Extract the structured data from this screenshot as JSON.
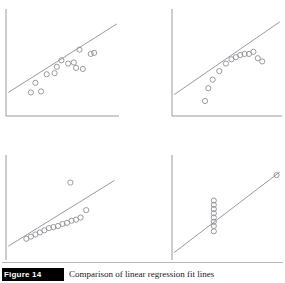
{
  "figure": {
    "caption_tag": "Figure 14",
    "caption_text": "Comparison of linear regression fit lines",
    "background_color": "#ffffff",
    "axis_color": "#9a9aa0",
    "line_color": "#8d8d97",
    "marker_color": "#8f8f99",
    "marker_radius": 2.6,
    "marker_stroke_width": 0.9
  },
  "chart_data": [
    {
      "id": "panel-top-left",
      "type": "scatter",
      "title": "",
      "xlabel": "",
      "ylabel": "",
      "xlim": [
        0,
        100
      ],
      "ylim": [
        0,
        100
      ],
      "grid": false,
      "legend": "none",
      "fit_line": {
        "x": [
          2,
          98
        ],
        "y": [
          22,
          86
        ]
      },
      "points": [
        {
          "x": 22,
          "y": 22
        },
        {
          "x": 31,
          "y": 23
        },
        {
          "x": 26,
          "y": 31
        },
        {
          "x": 36,
          "y": 39
        },
        {
          "x": 43,
          "y": 40
        },
        {
          "x": 45,
          "y": 46
        },
        {
          "x": 49,
          "y": 52
        },
        {
          "x": 55,
          "y": 49
        },
        {
          "x": 60,
          "y": 50
        },
        {
          "x": 62,
          "y": 45
        },
        {
          "x": 68,
          "y": 44
        },
        {
          "x": 65,
          "y": 62
        },
        {
          "x": 75,
          "y": 58
        },
        {
          "x": 78,
          "y": 59
        }
      ]
    },
    {
      "id": "panel-top-right",
      "type": "scatter",
      "title": "",
      "xlabel": "",
      "ylabel": "",
      "xlim": [
        0,
        100
      ],
      "ylim": [
        0,
        100
      ],
      "grid": false,
      "legend": "none",
      "fit_line": {
        "x": [
          2,
          98
        ],
        "y": [
          20,
          88
        ]
      },
      "points": [
        {
          "x": 30,
          "y": 14
        },
        {
          "x": 33,
          "y": 26
        },
        {
          "x": 37,
          "y": 34
        },
        {
          "x": 43,
          "y": 42
        },
        {
          "x": 49,
          "y": 49
        },
        {
          "x": 54,
          "y": 53
        },
        {
          "x": 58,
          "y": 55
        },
        {
          "x": 62,
          "y": 57
        },
        {
          "x": 66,
          "y": 58
        },
        {
          "x": 70,
          "y": 58
        },
        {
          "x": 74,
          "y": 60
        },
        {
          "x": 78,
          "y": 54
        },
        {
          "x": 82,
          "y": 51
        }
      ]
    },
    {
      "id": "panel-bottom-left",
      "type": "scatter",
      "title": "",
      "xlabel": "",
      "ylabel": "",
      "xlim": [
        0,
        100
      ],
      "ylim": [
        0,
        100
      ],
      "grid": false,
      "legend": "none",
      "fit_line": {
        "x": [
          2,
          96
        ],
        "y": [
          14,
          76
        ]
      },
      "points": [
        {
          "x": 18,
          "y": 21
        },
        {
          "x": 22,
          "y": 23
        },
        {
          "x": 26,
          "y": 25
        },
        {
          "x": 30,
          "y": 27
        },
        {
          "x": 34,
          "y": 29
        },
        {
          "x": 38,
          "y": 31
        },
        {
          "x": 42,
          "y": 32
        },
        {
          "x": 46,
          "y": 33
        },
        {
          "x": 50,
          "y": 35
        },
        {
          "x": 54,
          "y": 36
        },
        {
          "x": 58,
          "y": 38
        },
        {
          "x": 62,
          "y": 39
        },
        {
          "x": 66,
          "y": 41
        },
        {
          "x": 57,
          "y": 74
        },
        {
          "x": 71,
          "y": 48
        }
      ]
    },
    {
      "id": "panel-bottom-right",
      "type": "scatter",
      "title": "",
      "xlabel": "",
      "ylabel": "",
      "xlim": [
        0,
        100
      ],
      "ylim": [
        0,
        100
      ],
      "grid": false,
      "legend": "none",
      "fit_line": {
        "x": [
          2,
          98
        ],
        "y": [
          8,
          84
        ]
      },
      "points": [
        {
          "x": 38,
          "y": 28
        },
        {
          "x": 38,
          "y": 33
        },
        {
          "x": 38,
          "y": 37
        },
        {
          "x": 38,
          "y": 41
        },
        {
          "x": 38,
          "y": 45
        },
        {
          "x": 38,
          "y": 49
        },
        {
          "x": 38,
          "y": 53
        },
        {
          "x": 38,
          "y": 57
        },
        {
          "x": 95,
          "y": 81
        }
      ]
    }
  ]
}
